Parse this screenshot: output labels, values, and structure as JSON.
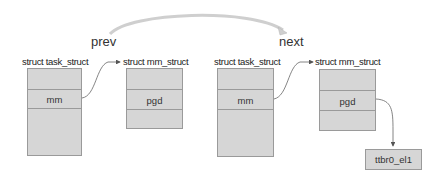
{
  "diagram": {
    "links": {
      "prev": "prev",
      "next": "next"
    },
    "structs": [
      {
        "title": "struct task_struct",
        "fields": [
          "",
          "mm",
          ""
        ]
      },
      {
        "title": "struct mm_struct",
        "fields": [
          "",
          "pgd",
          ""
        ]
      },
      {
        "title": "struct task_struct",
        "fields": [
          "",
          "mm",
          ""
        ]
      },
      {
        "title": "struct mm_struct",
        "fields": [
          "",
          "pgd",
          ""
        ]
      }
    ],
    "register": "ttbr0_el1",
    "colors": {
      "box_fill": "#d6d6d6",
      "box_border": "#9a9a9a",
      "arrow": "#7a7a7a",
      "arc": "#c8c8c8"
    }
  }
}
